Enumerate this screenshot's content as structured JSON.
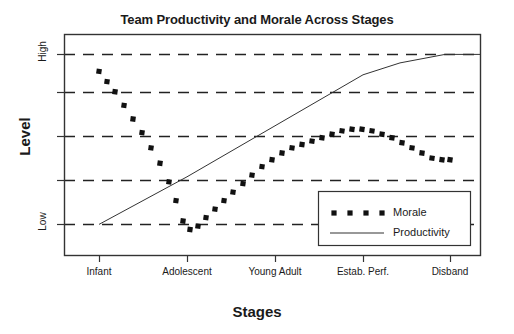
{
  "chart_data": {
    "type": "line",
    "title": "Team Productivity and Morale Across Stages",
    "xlabel": "Stages",
    "ylabel": "Level",
    "categories": [
      "Infant",
      "Adolescent",
      "Young Adult",
      "Estab. Perf.",
      "Disband"
    ],
    "ylim": [
      -18,
      112
    ],
    "ytick_values": [
      0,
      100
    ],
    "ytick_labels": [
      "Low",
      "High"
    ],
    "gridlines": [
      0,
      26,
      52,
      78,
      100
    ],
    "grid": true,
    "legend_position": "lower right",
    "series": [
      {
        "name": "Morale",
        "style": "dotted-square-markers",
        "color": "#111111",
        "x": [
          "Infant",
          "Adolescent",
          "Young Adult",
          "Estab. Perf.",
          "Disband"
        ],
        "values": [
          90,
          -3,
          26,
          52,
          38
        ],
        "dense_points": [
          [
            99,
            90
          ],
          [
            107,
            84
          ],
          [
            115,
            78
          ],
          [
            124,
            70
          ],
          [
            133,
            62
          ],
          [
            142,
            54
          ],
          [
            151,
            45
          ],
          [
            160,
            36
          ],
          [
            169,
            25
          ],
          [
            176,
            14
          ],
          [
            183,
            2
          ],
          [
            190,
            -3
          ],
          [
            198,
            -1
          ],
          [
            206,
            4
          ],
          [
            215,
            9
          ],
          [
            224,
            14
          ],
          [
            233,
            19
          ],
          [
            243,
            24
          ],
          [
            252,
            29
          ],
          [
            262,
            34
          ],
          [
            272,
            38
          ],
          [
            282,
            42
          ],
          [
            292,
            45
          ],
          [
            302,
            47
          ],
          [
            312,
            49
          ],
          [
            322,
            51
          ],
          [
            332,
            53
          ],
          [
            342,
            55
          ],
          [
            352,
            56
          ],
          [
            362,
            56
          ],
          [
            372,
            55
          ],
          [
            382,
            53
          ],
          [
            392,
            51
          ],
          [
            402,
            48
          ],
          [
            412,
            45
          ],
          [
            422,
            42
          ],
          [
            432,
            39
          ],
          [
            442,
            38
          ],
          [
            450,
            38
          ]
        ]
      },
      {
        "name": "Productivity",
        "style": "thin-solid-line",
        "color": "#333333",
        "x": [
          "Infant",
          "Adolescent",
          "Young Adult",
          "Estab. Perf.",
          "Disband"
        ],
        "values": [
          0,
          28,
          58,
          88,
          100
        ],
        "dense_points": [
          [
            99,
            0
          ],
          [
            187,
            28
          ],
          [
            275,
            58
          ],
          [
            363,
            88
          ],
          [
            400,
            95
          ],
          [
            445,
            100
          ],
          [
            480,
            100
          ]
        ]
      }
    ],
    "legend_entries": [
      {
        "label": "Morale",
        "style": "dotted-square-markers"
      },
      {
        "label": "Productivity",
        "style": "thin-solid-line"
      }
    ]
  },
  "axes": {
    "y_tick_high": "High",
    "y_tick_low": "Low"
  },
  "colors": {
    "frame": "#333333",
    "grid": "#222222",
    "morale": "#111111",
    "productivity": "#333333",
    "text": "#1a1a1a",
    "background": "#ffffff"
  }
}
